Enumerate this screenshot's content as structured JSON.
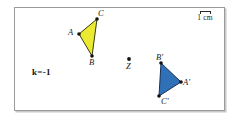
{
  "figure": {
    "background_color": "#ffffff",
    "frame_border_color": "#9b9b9b",
    "scale": {
      "bar_label": "1 cm",
      "icon": "scale-bar-icon"
    },
    "parameter": {
      "label": "k=-1"
    },
    "centre_point": {
      "label": "Z",
      "x": 128,
      "y": 58,
      "color": "#111111"
    },
    "shapes": [
      {
        "name": "triangle-abc",
        "fill": "#eaea32",
        "stroke": "#3a3a12",
        "points": "78,33 96,18 91,55",
        "vertices": [
          {
            "label": "A",
            "x": 78,
            "y": 33,
            "label_x": 67,
            "label_y": 27
          },
          {
            "label": "C",
            "x": 96,
            "y": 18,
            "label_x": 97,
            "label_y": 8
          },
          {
            "label": "B",
            "x": 91,
            "y": 55,
            "label_x": 88,
            "label_y": 57
          }
        ]
      },
      {
        "name": "triangle-abc-prime",
        "fill": "#2f70b6",
        "stroke": "#17325a",
        "points": "180,81 160,62 158,95",
        "vertices": [
          {
            "label": "A'",
            "x": 180,
            "y": 81,
            "label_x": 182,
            "label_y": 77
          },
          {
            "label": "B'",
            "x": 160,
            "y": 62,
            "label_x": 155,
            "label_y": 52
          },
          {
            "label": "C'",
            "x": 158,
            "y": 95,
            "label_x": 160,
            "label_y": 96
          }
        ]
      }
    ]
  }
}
